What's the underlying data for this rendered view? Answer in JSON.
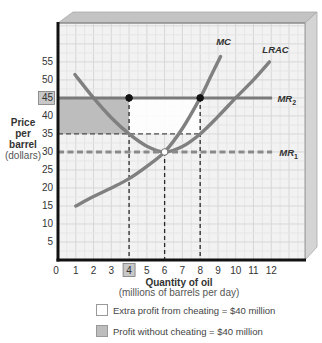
{
  "chart_data": {
    "type": "line",
    "title": "",
    "xlabel": "Quantity of oil",
    "xlabel_sub": "(millions of barrels per day)",
    "ylabel_lines": [
      "Price",
      "per",
      "barrel"
    ],
    "ylabel_sub": "(dollars)",
    "xlim": [
      0,
      13.9
    ],
    "ylim": [
      0,
      65.8
    ],
    "x_ticks": [
      0,
      1,
      2,
      3,
      4,
      5,
      6,
      7,
      8,
      9,
      10,
      11,
      12
    ],
    "y_ticks": [
      5,
      10,
      15,
      20,
      25,
      30,
      35,
      40,
      45,
      50,
      55
    ],
    "highlighted_x_tick": 4,
    "highlighted_y_tick": 45,
    "grid": true,
    "series": [
      {
        "name": "MC",
        "style": "curve",
        "color": "#808080",
        "points": [
          [
            1,
            15
          ],
          [
            2,
            17.6
          ],
          [
            3,
            20
          ],
          [
            4,
            22.6
          ],
          [
            5,
            26
          ],
          [
            6,
            30
          ],
          [
            7,
            36.5
          ],
          [
            8,
            45
          ],
          [
            8.6,
            51
          ],
          [
            9.15,
            56.5
          ]
        ],
        "label_pos": [
          8.9,
          59.8
        ]
      },
      {
        "name": "LRAC",
        "style": "curve",
        "color": "#808080",
        "points": [
          [
            0.95,
            51.5
          ],
          [
            2,
            45
          ],
          [
            3,
            39.5
          ],
          [
            4,
            35
          ],
          [
            5,
            31.6
          ],
          [
            6,
            30
          ],
          [
            7,
            31.5
          ],
          [
            8,
            35
          ],
          [
            9,
            39.8
          ],
          [
            10,
            45
          ],
          [
            11,
            50
          ],
          [
            11.9,
            55
          ]
        ],
        "label_pos": [
          11.5,
          57.5
        ]
      },
      {
        "name": "MR",
        "subscript": "2",
        "style": "solid",
        "color": "#7a7a7a",
        "points": [
          [
            0,
            45
          ],
          [
            12.05,
            45
          ]
        ],
        "label_pos": [
          12.35,
          44
        ]
      },
      {
        "name": "MR",
        "subscript": "1",
        "style": "dashed",
        "color": "#8a8a8a",
        "points": [
          [
            0,
            30
          ],
          [
            12.05,
            30
          ]
        ],
        "label_pos": [
          12.45,
          29
        ]
      }
    ],
    "regions": [
      {
        "name": "profit-without-cheating",
        "x": [
          0,
          4
        ],
        "y": [
          35,
          45
        ],
        "fill": "#bdbdbd"
      },
      {
        "name": "extra-profit-from-cheating",
        "x": [
          4,
          8
        ],
        "y": [
          35,
          45
        ],
        "fill": "#ffffff"
      }
    ],
    "reference_lines": [
      {
        "orientation": "vertical",
        "x": 4,
        "y": [
          0,
          45
        ]
      },
      {
        "orientation": "vertical",
        "x": 6,
        "y": [
          0,
          30
        ]
      },
      {
        "orientation": "vertical",
        "x": 8,
        "y": [
          0,
          45
        ]
      },
      {
        "orientation": "horizontal",
        "y": 35,
        "x": [
          0,
          8
        ]
      }
    ],
    "points": [
      {
        "x": 4,
        "y": 45,
        "fill": "filled"
      },
      {
        "x": 8,
        "y": 45,
        "fill": "filled"
      },
      {
        "x": 6,
        "y": 30,
        "fill": "open"
      }
    ],
    "legend": [
      {
        "label": "Extra profit from cheating = $40 million",
        "swatch": "#ffffff"
      },
      {
        "label": "Profit without cheating = $40 million",
        "swatch": "#bdbdbd"
      }
    ]
  }
}
